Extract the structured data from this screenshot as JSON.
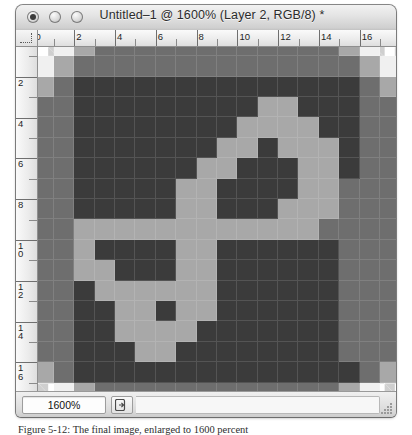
{
  "window": {
    "title": "Untitled–1 @ 1600% (Layer 2, RGB/8) *",
    "traffic_lights": [
      {
        "name": "close",
        "label": "Close"
      },
      {
        "name": "minimize",
        "label": "Minimize"
      },
      {
        "name": "zoom",
        "label": "Zoom"
      }
    ]
  },
  "rulers": {
    "unit": "pixels",
    "horizontal_labels": [
      "0",
      "2",
      "4",
      "6",
      "8",
      "10",
      "12",
      "14",
      "16"
    ],
    "vertical_labels": [
      "0",
      "2",
      "4",
      "6",
      "8",
      "10",
      "12",
      "14",
      "16"
    ]
  },
  "statusbar": {
    "zoom_value": "1600%",
    "doc_info_icon": "document-arrow-icon",
    "resize_grip_icon": "resize-grip-icon"
  },
  "caption": {
    "text": "Figure 5-12: The final image, enlarged to 1600 percent"
  },
  "canvas": {
    "zoom_percent": 1600,
    "grid_cols": 18,
    "grid_rows": 18,
    "palette": {
      "transparent": "transparent",
      "dark": "#3b3b3b",
      "mid_dark": "#545454",
      "mid": "#6e6e6e",
      "light": "#a8a8a8",
      "lighter": "#c4c4c4",
      "white": "#f0f0f0"
    },
    "pixels": [
      [
        "t",
        "w",
        "l",
        "m",
        "m",
        "m",
        "m",
        "m",
        "m",
        "m",
        "m",
        "m",
        "m",
        "m",
        "m",
        "l",
        "w",
        "t"
      ],
      [
        "w",
        "l",
        "m",
        "m",
        "m",
        "m",
        "m",
        "m",
        "m",
        "m",
        "m",
        "m",
        "m",
        "m",
        "m",
        "m",
        "l",
        "w"
      ],
      [
        "l",
        "m",
        "d",
        "d",
        "d",
        "d",
        "d",
        "d",
        "d",
        "d",
        "d",
        "d",
        "d",
        "d",
        "d",
        "d",
        "m",
        "l"
      ],
      [
        "m",
        "m",
        "d",
        "d",
        "d",
        "d",
        "d",
        "d",
        "d",
        "d",
        "d",
        "l",
        "l",
        "d",
        "d",
        "d",
        "m",
        "m"
      ],
      [
        "m",
        "m",
        "d",
        "d",
        "d",
        "d",
        "d",
        "d",
        "d",
        "d",
        "l",
        "l",
        "l",
        "l",
        "d",
        "d",
        "m",
        "m"
      ],
      [
        "m",
        "m",
        "d",
        "d",
        "d",
        "d",
        "d",
        "d",
        "d",
        "l",
        "l",
        "d",
        "l",
        "l",
        "l",
        "d",
        "m",
        "m"
      ],
      [
        "m",
        "m",
        "d",
        "d",
        "d",
        "d",
        "d",
        "d",
        "l",
        "l",
        "d",
        "d",
        "d",
        "l",
        "l",
        "d",
        "m",
        "m"
      ],
      [
        "m",
        "m",
        "d",
        "d",
        "d",
        "d",
        "d",
        "l",
        "l",
        "d",
        "d",
        "d",
        "d",
        "l",
        "l",
        "m",
        "m",
        "m"
      ],
      [
        "m",
        "m",
        "d",
        "d",
        "d",
        "d",
        "d",
        "l",
        "l",
        "d",
        "d",
        "d",
        "l",
        "l",
        "l",
        "m",
        "m",
        "m"
      ],
      [
        "m",
        "m",
        "l",
        "l",
        "l",
        "l",
        "l",
        "l",
        "l",
        "l",
        "l",
        "l",
        "l",
        "l",
        "m",
        "m",
        "m",
        "m"
      ],
      [
        "m",
        "m",
        "l",
        "d",
        "d",
        "d",
        "d",
        "l",
        "l",
        "d",
        "d",
        "d",
        "d",
        "d",
        "d",
        "m",
        "m",
        "m"
      ],
      [
        "m",
        "m",
        "l",
        "l",
        "d",
        "d",
        "d",
        "l",
        "l",
        "d",
        "d",
        "d",
        "d",
        "d",
        "d",
        "m",
        "m",
        "m"
      ],
      [
        "m",
        "m",
        "d",
        "l",
        "l",
        "l",
        "l",
        "l",
        "l",
        "d",
        "d",
        "d",
        "d",
        "d",
        "d",
        "m",
        "m",
        "m"
      ],
      [
        "m",
        "m",
        "d",
        "d",
        "l",
        "l",
        "d",
        "l",
        "l",
        "d",
        "d",
        "d",
        "d",
        "d",
        "d",
        "m",
        "m",
        "m"
      ],
      [
        "m",
        "m",
        "d",
        "d",
        "l",
        "l",
        "l",
        "l",
        "d",
        "d",
        "d",
        "d",
        "d",
        "d",
        "d",
        "m",
        "m",
        "m"
      ],
      [
        "m",
        "m",
        "d",
        "d",
        "d",
        "l",
        "l",
        "d",
        "d",
        "d",
        "d",
        "d",
        "d",
        "d",
        "d",
        "m",
        "m",
        "m"
      ],
      [
        "l",
        "m",
        "d",
        "d",
        "d",
        "d",
        "d",
        "d",
        "d",
        "d",
        "d",
        "d",
        "d",
        "d",
        "d",
        "d",
        "m",
        "l"
      ],
      [
        "t",
        "w",
        "l",
        "m",
        "m",
        "m",
        "m",
        "m",
        "m",
        "m",
        "m",
        "m",
        "m",
        "m",
        "m",
        "l",
        "w",
        "t"
      ]
    ]
  }
}
